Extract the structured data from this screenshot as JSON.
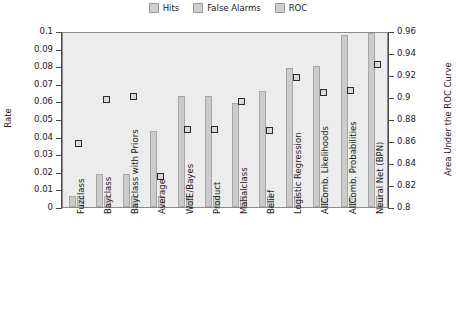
{
  "chart_data": {
    "type": "bar",
    "title": "",
    "subtitle": "",
    "xlabel": "",
    "ylabel": "Rate",
    "y2label": "Area Under the ROC Curve",
    "ylim": [
      0,
      0.1
    ],
    "y2lim": [
      0.8,
      0.96
    ],
    "yticks": [
      "0",
      "0.01",
      "0.02",
      "0.03",
      "0.04",
      "0.05",
      "0.06",
      "0.07",
      "0.08",
      "0.09",
      "0.1"
    ],
    "ytick_values": [
      0,
      0.01,
      0.02,
      0.03,
      0.04,
      0.05,
      0.06,
      0.07,
      0.08,
      0.09,
      0.1
    ],
    "y2ticks": [
      "0.8",
      "0.82",
      "0.84",
      "0.86",
      "0.88",
      "0.9",
      "0.92",
      "0.94",
      "0.96"
    ],
    "y2tick_values": [
      0.8,
      0.82,
      0.84,
      0.86,
      0.88,
      0.9,
      0.92,
      0.94,
      0.96
    ],
    "grid": false,
    "legend_position": "top-center",
    "categories": [
      "Fuzclass",
      "Bayclass",
      "Bayclass with Priors",
      "Average",
      "WofE/Bayes",
      "Product",
      "Mahalclass",
      "Belief",
      "Logistic Regression",
      "AllComb. Likelihoods",
      "AllComb. Probabilities",
      "Neural Net (BPN)"
    ],
    "series": [
      {
        "name": "Hits",
        "axis": "left",
        "color": "#cbcbcb",
        "values": [
          0.006,
          0.019,
          0.019,
          0.043,
          0.063,
          0.063,
          0.059,
          0.066,
          0.079,
          0.08,
          0.098,
          0.099
        ]
      },
      {
        "name": "False Alarms",
        "axis": "left",
        "color": "#d2d2d2",
        "values": [
          0.006,
          0.006,
          0.006,
          0.006,
          0.006,
          0.006,
          0.006,
          0.006,
          0.006,
          0.006,
          0.006,
          0.006
        ]
      },
      {
        "name": "ROC",
        "axis": "right",
        "marker": "square",
        "color": "#d8d8d8",
        "values": [
          0.86,
          0.9,
          0.902,
          0.83,
          0.872,
          0.872,
          0.898,
          0.871,
          0.92,
          0.906,
          0.908,
          0.931
        ]
      }
    ]
  },
  "legend": {
    "items": [
      {
        "label": "Hits"
      },
      {
        "label": "False Alarms"
      },
      {
        "label": "ROC"
      }
    ]
  },
  "axes": {
    "left_title": "Rate",
    "right_title": "Area Under the ROC Curve"
  }
}
